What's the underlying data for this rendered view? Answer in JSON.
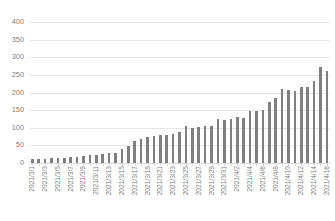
{
  "chart_data": {
    "type": "bar",
    "title": "",
    "subtitle": "",
    "xlabel": "",
    "ylabel": "",
    "ylim": [
      0,
      400
    ],
    "y_ticks": [
      0,
      50,
      100,
      150,
      200,
      250,
      300,
      350,
      400
    ],
    "y_tick_labels": [
      "0",
      "50",
      "100",
      "150",
      "200",
      "250",
      "300",
      "350",
      "400"
    ],
    "grid": true,
    "legend": false,
    "legend_position": "none",
    "bar_color": "#808080",
    "gridline_color": "#E6E6E6",
    "axis_text_color": "#808080",
    "x_tick_label_rotation": -90,
    "x_tick_label_interval": 2,
    "categories": [
      "2021/3/1",
      "2021/3/2",
      "2021/3/3",
      "2021/3/4",
      "2021/3/5",
      "2021/3/6",
      "2021/3/7",
      "2021/3/8",
      "2021/3/9",
      "2021/3/10",
      "2021/3/11",
      "2021/3/12",
      "2021/3/13",
      "2021/3/14",
      "2021/3/15",
      "2021/3/16",
      "2021/3/17",
      "2021/3/18",
      "2021/3/19",
      "2021/3/20",
      "2021/3/21",
      "2021/3/22",
      "2021/3/23",
      "2021/3/24",
      "2021/3/25",
      "2021/3/26",
      "2021/3/27",
      "2021/3/28",
      "2021/3/29",
      "2021/3/30",
      "2021/3/31",
      "2021/4/1",
      "2021/4/2",
      "2021/4/3",
      "2021/4/4",
      "2021/4/5",
      "2021/4/6",
      "2021/4/7",
      "2021/4/8",
      "2021/4/9",
      "2021/4/10",
      "2021/4/11",
      "2021/4/12",
      "2021/4/13",
      "2021/4/14",
      "2021/4/15",
      "2021/4/16"
    ],
    "visible_tick_labels": [
      "2021/3/1",
      "",
      "2021/3/3",
      "",
      "2021/3/5",
      "",
      "2021/3/7",
      "",
      "2021/3/9",
      "",
      "2021/3/11",
      "",
      "2021/3/13",
      "",
      "2021/3/15",
      "",
      "2021/3/17",
      "",
      "2021/3/19",
      "",
      "2021/3/21",
      "",
      "2021/3/23",
      "",
      "2021/3/25",
      "",
      "2021/3/27",
      "",
      "2021/3/29",
      "",
      "2021/3/31",
      "",
      "2021/4/2",
      "",
      "2021/4/4",
      "",
      "2021/4/6",
      "",
      "2021/4/8",
      "",
      "2021/4/10",
      "",
      "2021/4/12",
      "",
      "2021/4/14",
      "",
      "2021/4/16"
    ],
    "values": [
      10,
      11,
      12,
      13,
      14,
      15,
      17,
      18,
      20,
      22,
      23,
      25,
      27,
      29,
      40,
      48,
      62,
      68,
      74,
      78,
      79,
      80,
      82,
      87,
      105,
      99,
      101,
      104,
      106,
      126,
      121,
      124,
      130,
      127,
      148,
      148,
      151,
      172,
      184,
      210,
      207,
      203,
      216,
      217,
      234,
      272,
      262
    ],
    "series_name": "Cumulative count"
  }
}
